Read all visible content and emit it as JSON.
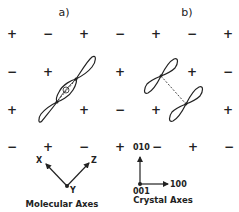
{
  "panels": {
    "a": {
      "label": "a)"
    },
    "b": {
      "label": "b)"
    }
  },
  "sign_grid": {
    "rows": [
      [
        "+",
        "−",
        "+",
        "−",
        "+",
        "−",
        "+"
      ],
      [
        "−",
        "+",
        "",
        "+",
        "",
        "+",
        "−"
      ],
      [
        "+",
        "",
        "+",
        "−",
        "+",
        "",
        "+"
      ],
      [
        "−",
        "+",
        "−",
        "+",
        "−",
        "+",
        "−"
      ]
    ]
  },
  "orbitals": {
    "a": {
      "description": "overlapping p-orbital pair (molecular)"
    },
    "b": {
      "description": "two p-orbitals linked by dashed line"
    }
  },
  "molecular_axes": {
    "caption": "Molecular Axes",
    "x_label": "X",
    "y_label": "Y",
    "z_label": "Z"
  },
  "crystal_axes": {
    "caption": "Crystal Axes",
    "vertical_label": "010",
    "horizontal_label": "100",
    "origin_label": "001"
  }
}
